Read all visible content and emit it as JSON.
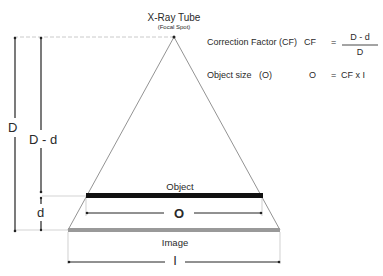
{
  "diagram": {
    "source": {
      "title": "X-Ray Tube",
      "subtitle": "(Focal Spot)"
    },
    "dimensions": {
      "source_to_image": "D",
      "source_to_object": "D - d",
      "object_to_image": "d"
    },
    "object": {
      "label": "Object",
      "size_label": "O",
      "color": "#111111"
    },
    "image": {
      "label": "Image",
      "size_label": "I",
      "color": "#999999"
    },
    "formulas": {
      "correction_factor": {
        "name": "Correction Factor (CF)",
        "symbol": "CF",
        "equals": "=",
        "numerator": "D - d",
        "denominator": "D"
      },
      "object_size": {
        "name": "Object size   (O)",
        "symbol": "O",
        "equals": "=",
        "expression": "CF x I"
      }
    }
  }
}
